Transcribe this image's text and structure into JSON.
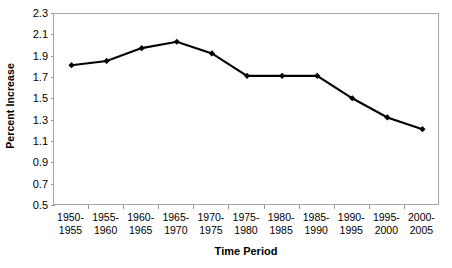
{
  "chart_data": {
    "type": "line",
    "title": "",
    "xlabel": "Time Period",
    "ylabel": "Percent Increase",
    "categories": [
      "1950-1955",
      "1955-1960",
      "1960-1965",
      "1965-1970",
      "1970-1975",
      "1975-1980",
      "1980-1985",
      "1985-1990",
      "1990-1995",
      "1995-2000",
      "2000-2005"
    ],
    "category_lines": [
      [
        "1950-",
        "1955"
      ],
      [
        "1955-",
        "1960"
      ],
      [
        "1960-",
        "1965"
      ],
      [
        "1965-",
        "1970"
      ],
      [
        "1970-",
        "1975"
      ],
      [
        "1975-",
        "1980"
      ],
      [
        "1980-",
        "1985"
      ],
      [
        "1985-",
        "1990"
      ],
      [
        "1990-",
        "1995"
      ],
      [
        "1995-",
        "2000"
      ],
      [
        "2000-",
        "2005"
      ]
    ],
    "values": [
      1.82,
      1.86,
      1.98,
      2.04,
      1.93,
      1.72,
      1.72,
      1.72,
      1.51,
      1.33,
      1.22
    ],
    "ylim": [
      0.5,
      2.3
    ],
    "ytick_step": 0.2,
    "ytick_labels": [
      "2.3",
      "2.1",
      "1.9",
      "1.7",
      "1.5",
      "1.3",
      "1.1",
      "0.9",
      "0.7",
      "0.5"
    ],
    "ytick_values": [
      2.3,
      2.1,
      1.9,
      1.7,
      1.5,
      1.3,
      1.1,
      0.9,
      0.7,
      0.5
    ],
    "grid": false,
    "legend": false,
    "legend_position": "none",
    "series_color": "#000000",
    "marker": "diamond",
    "axis_color": "#a6a6a6",
    "tick_color": "#9a9a9a",
    "background_color": "#ffffff"
  }
}
